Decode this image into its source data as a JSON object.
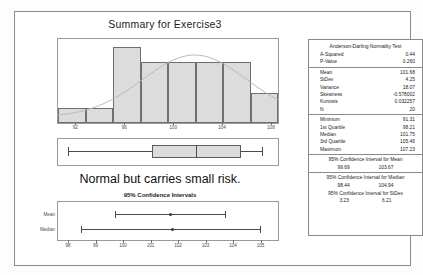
{
  "report": {
    "title": "Summary for Exercise3",
    "annotation": "Normal but carries small risk.",
    "ci_plot_title": "95% Confidence Intervals"
  },
  "stats_panel": {
    "ad_header": "Anderson-Darling Normality Test",
    "ad_rows": [
      {
        "label": "A-Squared",
        "value": "0.44"
      },
      {
        "label": "P-Value",
        "value": "0.260"
      }
    ],
    "moment_rows": [
      {
        "label": "Mean",
        "value": "101.68"
      },
      {
        "label": "StDev",
        "value": "4.25"
      },
      {
        "label": "Variance",
        "value": "18.07"
      },
      {
        "label": "Skewness",
        "value": "-0.578002"
      },
      {
        "label": "Kurtosis",
        "value": "0.032257"
      },
      {
        "label": "N",
        "value": "20"
      }
    ],
    "quantile_rows": [
      {
        "label": "Minimum",
        "value": "91.31"
      },
      {
        "label": "1st Quartile",
        "value": "98.21"
      },
      {
        "label": "Median",
        "value": "101.75"
      },
      {
        "label": "3rd Quartile",
        "value": "105.46"
      },
      {
        "label": "Maximum",
        "value": "107.23"
      }
    ],
    "ci_blocks": [
      {
        "header": "95% Confidence Interval for Mean",
        "lower": "99.69",
        "upper": "103.67"
      },
      {
        "header": "95% Confidence Interval for Median",
        "lower": "98.44",
        "upper": "104.94"
      },
      {
        "header": "95% Confidence Interval for StDev",
        "lower": "3.23",
        "upper": "6.21"
      }
    ]
  },
  "chart_data": [
    {
      "type": "bar",
      "title": "Histogram with normal curve",
      "xlabel": "",
      "ylabel": "Frequency",
      "categories": [
        "92",
        "94",
        "96",
        "98",
        "100",
        "102",
        "104",
        "106"
      ],
      "values": [
        1,
        1,
        5,
        4,
        4,
        4,
        4,
        2
      ],
      "ylim": [
        0,
        5
      ],
      "xlim": [
        90.5,
        108.5
      ],
      "axis_ticks": [
        "92",
        "96",
        "100",
        "104",
        "108"
      ],
      "axis_tick_values": [
        92,
        96,
        100,
        104,
        108
      ],
      "grid": false,
      "overlay": {
        "type": "line",
        "name": "normal curve",
        "mean": 101.68,
        "stdev": 4.25
      }
    },
    {
      "type": "boxplot",
      "title": "Boxplot",
      "minimum": 91.31,
      "q1": 98.21,
      "median": 101.75,
      "q3": 105.46,
      "maximum": 107.23,
      "xlim": [
        90.5,
        108.5
      ]
    },
    {
      "type": "line",
      "title": "95% Confidence Intervals",
      "categories": [
        "Mean",
        "Median"
      ],
      "series": [
        {
          "name": "Mean",
          "lower": 99.69,
          "upper": 103.67,
          "center": 101.68
        },
        {
          "name": "Median",
          "lower": 98.44,
          "upper": 104.94,
          "center": 101.75
        }
      ],
      "axis_ticks": [
        "98",
        "99",
        "100",
        "101",
        "102",
        "103",
        "104",
        "105"
      ],
      "axis_tick_values": [
        98,
        99,
        100,
        101,
        102,
        103,
        104,
        105
      ],
      "xlim": [
        97.6,
        105.6
      ],
      "grid": false
    }
  ]
}
